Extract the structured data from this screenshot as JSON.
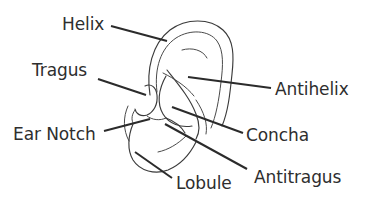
{
  "diagram": {
    "type": "labeled-anatomical-diagram",
    "background_color": "#ffffff",
    "outline_color": "#3b3b3b",
    "leader_line_color": "#2b2b2b",
    "text_color": "#2e2e2e"
  },
  "labels": [
    {
      "id": "helix",
      "text": "Helix",
      "side": "left",
      "text_x": 62,
      "text_y": 16,
      "leader": {
        "x1": 111,
        "y1": 26,
        "x2": 167,
        "y2": 41
      }
    },
    {
      "id": "tragus",
      "text": "Tragus",
      "side": "left",
      "text_x": 32,
      "text_y": 62,
      "leader": {
        "x1": 98,
        "y1": 79,
        "x2": 146,
        "y2": 95
      }
    },
    {
      "id": "ear-notch",
      "text": "Ear Notch",
      "side": "left",
      "text_x": 13,
      "text_y": 126,
      "leader": {
        "x1": 104,
        "y1": 131,
        "x2": 150,
        "y2": 119
      }
    },
    {
      "id": "antihelix",
      "text": "Antihelix",
      "side": "right",
      "text_x": 275,
      "text_y": 81,
      "leader": {
        "x1": 271,
        "y1": 88,
        "x2": 188,
        "y2": 77
      }
    },
    {
      "id": "concha",
      "text": "Concha",
      "side": "right",
      "text_x": 246,
      "text_y": 127,
      "leader": {
        "x1": 243,
        "y1": 133,
        "x2": 172,
        "y2": 107
      }
    },
    {
      "id": "antitragus",
      "text": "Antitragus",
      "side": "right",
      "text_x": 254,
      "text_y": 169,
      "leader": {
        "x1": 247,
        "y1": 169,
        "x2": 165,
        "y2": 124
      }
    },
    {
      "id": "lobule",
      "text": "Lobule",
      "side": "right",
      "text_x": 176,
      "text_y": 175,
      "leader": {
        "x1": 172,
        "y1": 178,
        "x2": 135,
        "y2": 152
      }
    }
  ],
  "ear_paths": {
    "helix_outer": "M150,95 C146,70 152,44 170,30 C186,18 210,18 223,30 C234,40 234,56 232,74 C230,94 228,112 222,126",
    "helix_inner": "M157,92 C154,68 161,48 176,38 C190,29 209,30 217,41 C224,51 223,66 221,82 C219,100 216,116 211,128",
    "crus_helix": "M163,73 C175,79 186,86 194,96",
    "antihelix_upper": "M182,50 C192,47 203,50 207,58",
    "antihelix_limb": "M167,70 C178,84 190,98 196,114 C200,124 200,132 196,139",
    "antihelix_lower": "M196,100 C204,112 208,124 206,134",
    "concha_bowl": "M166,76 C158,90 157,104 163,114 C169,124 181,128 192,126",
    "tragus": "M145,86 C151,83 156,87 157,95 C158,104 154,112 147,115 C141,117 136,114 135,109",
    "intertragic_notch": "M147,116 C152,120 160,121 166,118",
    "antitragus": "M166,118 C174,121 181,126 185,133",
    "ear_notch_arc": "M128,106 C123,117 123,130 129,141",
    "tragus_base": "M135,110 C132,114 131,119 133,123",
    "lobule": "M133,124 C128,136 127,150 133,160 C140,171 155,175 168,170 C180,165 190,154 196,142",
    "lobule_crease": "M186,136 C178,144 168,150 158,152"
  }
}
